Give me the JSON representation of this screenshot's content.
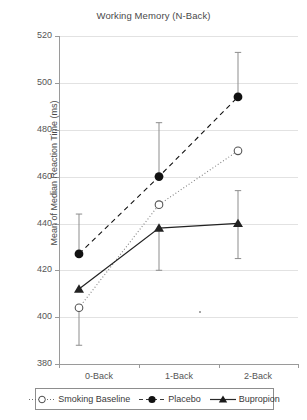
{
  "chart_data": {
    "type": "line",
    "title": "Working Memory (N-Back)",
    "xlabel": "",
    "ylabel": "Mean of Median Reaction Time (ms)",
    "categories": [
      "0-Back",
      "1-Back",
      "2-Back"
    ],
    "ylim": [
      380,
      520
    ],
    "yticks": [
      380,
      400,
      420,
      440,
      460,
      480,
      500,
      520
    ],
    "grid": true,
    "legend_position": "bottom",
    "series": [
      {
        "name": "Smoking Baseline",
        "marker": "open-circle",
        "line": "dotted",
        "color": "#808080",
        "values": [
          404,
          448,
          471
        ],
        "err_low": [
          388,
          448,
          471
        ],
        "err_high": [
          404,
          448,
          471
        ]
      },
      {
        "name": "Placebo",
        "marker": "filled-circle",
        "line": "dashed",
        "color": "#111111",
        "values": [
          427,
          460,
          494
        ],
        "err_low": [
          427,
          460,
          494
        ],
        "err_high": [
          444,
          483,
          513
        ]
      },
      {
        "name": "Bupropion",
        "marker": "filled-triangle",
        "line": "solid",
        "color": "#222222",
        "values": [
          412,
          438,
          440
        ],
        "err_low": [
          412,
          420,
          425
        ],
        "err_high": [
          412,
          438,
          454
        ]
      }
    ]
  },
  "chart": {
    "title": "Working Memory (N-Back)",
    "y_axis_title": "Mean of Median Reaction Time (ms)",
    "y_ticks": [
      "520",
      "500",
      "480",
      "460",
      "440",
      "420",
      "400",
      "380"
    ],
    "x_ticks": [
      "0-Back",
      "1-Back",
      "2-Back"
    ]
  },
  "legend": {
    "items": [
      {
        "label": "Smoking Baseline",
        "key": "open-circle-dotted"
      },
      {
        "label": "Placebo",
        "key": "filled-circle-dashed"
      },
      {
        "label": "Bupropion",
        "key": "filled-triangle-solid"
      }
    ]
  }
}
